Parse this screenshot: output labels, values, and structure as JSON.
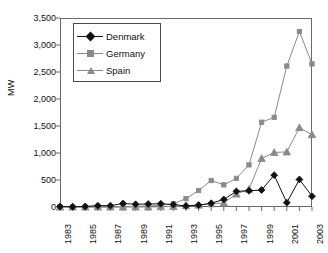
{
  "chart_data": {
    "type": "line",
    "title": "",
    "subtitle": "",
    "xlabel": "",
    "ylabel": "MW",
    "x": [
      1983,
      1984,
      1985,
      1986,
      1987,
      1988,
      1989,
      1990,
      1991,
      1992,
      1993,
      1994,
      1995,
      1996,
      1997,
      1998,
      1999,
      2000,
      2001,
      2002,
      2003
    ],
    "xlim": [
      1983,
      2003
    ],
    "ylim": [
      0,
      3500
    ],
    "y_ticks": [
      0,
      500,
      1000,
      1500,
      2000,
      2500,
      3000,
      3500
    ],
    "y_tick_labels": [
      "0",
      "500",
      "1,000",
      "1,500",
      "2,000",
      "2,500",
      "3,000",
      "3,500"
    ],
    "x_tick_labels": [
      "1983",
      "1985",
      "1987",
      "1989",
      "1991",
      "1993",
      "1995",
      "1997",
      "1999",
      "2001",
      "2003"
    ],
    "x_minor_ticks_every": 1,
    "x_labels_every": 2,
    "grid": false,
    "legend_position": "upper-left-inside",
    "series": [
      {
        "name": "Denmark",
        "marker": "diamond",
        "color": "#111111",
        "line_color": "#111111",
        "values": [
          10,
          5,
          10,
          25,
          25,
          65,
          50,
          55,
          60,
          45,
          20,
          35,
          70,
          140,
          290,
          300,
          315,
          590,
          80,
          510,
          200
        ]
      },
      {
        "name": "Germany",
        "marker": "square",
        "color": "#8a8a8a",
        "line_color": "#8a8a8a",
        "values": [
          0,
          0,
          0,
          0,
          0,
          5,
          10,
          20,
          30,
          60,
          155,
          305,
          490,
          410,
          530,
          780,
          1570,
          1660,
          2610,
          3250,
          2650
        ]
      },
      {
        "name": "Spain",
        "marker": "triangle",
        "color": "#8a8a8a",
        "line_color": "#8a8a8a",
        "values": [
          0,
          0,
          0,
          0,
          0,
          0,
          0,
          0,
          5,
          10,
          25,
          35,
          60,
          75,
          240,
          330,
          900,
          1010,
          1020,
          1470,
          1340
        ]
      }
    ]
  },
  "legend": {
    "items": [
      {
        "label": "Denmark"
      },
      {
        "label": "Germany"
      },
      {
        "label": "Spain"
      }
    ]
  },
  "axis": {
    "y_title": "MW"
  }
}
